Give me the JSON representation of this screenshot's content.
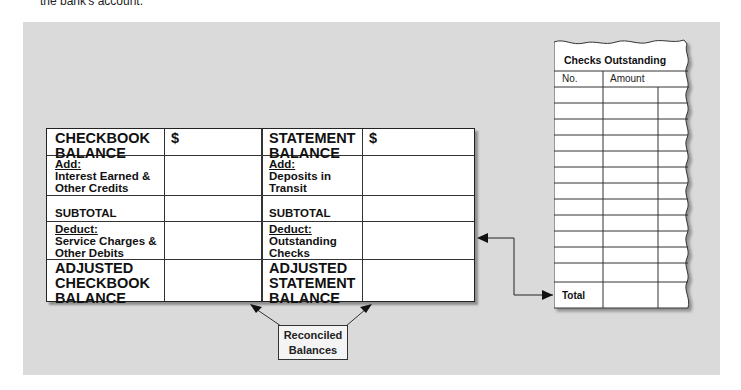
{
  "caption_fragment": "the bank's account.",
  "reconciliation_form": {
    "checkbook_side": {
      "balance_label": "CHECKBOOK BALANCE",
      "currency": "$",
      "add_heading": "Add:",
      "add_items": "Interest Earned & Other Credits",
      "subtotal_label": "SUBTOTAL",
      "deduct_heading": "Deduct:",
      "deduct_items": "Service Charges & Other Debits",
      "adjusted_label": "ADJUSTED CHECKBOOK BALANCE"
    },
    "statement_side": {
      "balance_label": "STATEMENT BALANCE",
      "currency": "$",
      "add_heading": "Add:",
      "add_items": "Deposits in Transit",
      "subtotal_label": "SUBTOTAL",
      "deduct_heading": "Deduct:",
      "deduct_items": "Outstanding Checks",
      "adjusted_label": "ADJUSTED STATEMENT BALANCE"
    }
  },
  "reconciled_box": {
    "line1": "Reconciled",
    "line2": "Balances"
  },
  "checks_outstanding": {
    "title": "Checks Outstanding",
    "columns": [
      "No.",
      "Amount"
    ],
    "blank_rows": 12,
    "total_label": "Total"
  },
  "colors": {
    "panel": "#dadada",
    "form_bg": "#ffffff",
    "lines": "#222222"
  }
}
